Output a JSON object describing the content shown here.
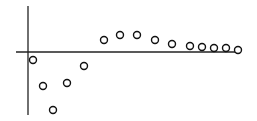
{
  "chart_data": {
    "type": "scatter",
    "title": "",
    "xlabel": "",
    "ylabel": "",
    "grid": false,
    "legend": null,
    "marker": "open-circle",
    "x": [
      1,
      2,
      3,
      4,
      5,
      6,
      7,
      8,
      9,
      10,
      11,
      12,
      13,
      14,
      15
    ],
    "values": [
      -0.14,
      -0.59,
      -1.0,
      -0.53,
      -0.24,
      0.21,
      0.29,
      0.29,
      0.21,
      0.14,
      0.1,
      0.09,
      0.07,
      0.07,
      0.03
    ],
    "ylim": [
      -1.1,
      0.8
    ],
    "colors": {
      "axis": "#222222",
      "marker_stroke": "#111111",
      "background": "#ffffff"
    }
  },
  "layout": {
    "origin_px": [
      28,
      52
    ],
    "y_axis_px": {
      "x": 28,
      "top": 6,
      "bottom": 115
    },
    "x_axis_px": {
      "y": 52,
      "left": 16,
      "right": 238
    },
    "point_px": [
      [
        33,
        60
      ],
      [
        43,
        86
      ],
      [
        53,
        110
      ],
      [
        67,
        83
      ],
      [
        84,
        66
      ],
      [
        104,
        40
      ],
      [
        120,
        35
      ],
      [
        137,
        35
      ],
      [
        155,
        40
      ],
      [
        172,
        44
      ],
      [
        190,
        46
      ],
      [
        202,
        47
      ],
      [
        214,
        48
      ],
      [
        226,
        48
      ],
      [
        238,
        50
      ]
    ],
    "marker_radius": 3.5
  }
}
